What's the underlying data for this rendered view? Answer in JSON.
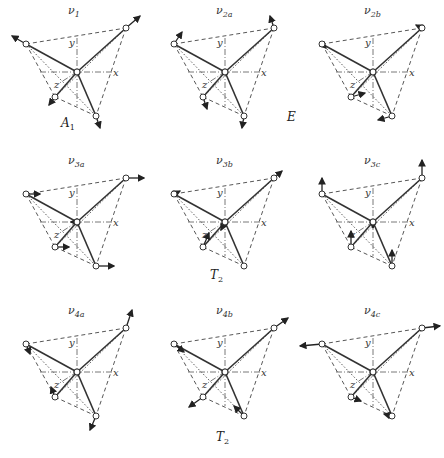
{
  "figure": {
    "axes_labels": {
      "x": "x",
      "y": "y",
      "z": "z"
    },
    "colors": {
      "line": "#333333",
      "dashed": "#444444",
      "atom_fill": "#ffffff",
      "arrow": "#222222"
    },
    "panels": [
      {
        "id": "v1",
        "label_base": "ν",
        "label_sub": "1",
        "arrows": "breathing"
      },
      {
        "id": "v2a",
        "label_base": "ν",
        "label_sub": "2a",
        "arrows": "bend-a"
      },
      {
        "id": "v2b",
        "label_base": "ν",
        "label_sub": "2b",
        "arrows": "bend-b"
      },
      {
        "id": "v3a",
        "label_base": "ν",
        "label_sub": "3a",
        "arrows": "x-stretch"
      },
      {
        "id": "v3b",
        "label_base": "ν",
        "label_sub": "3b",
        "arrows": "diag-stretch"
      },
      {
        "id": "v3c",
        "label_base": "ν",
        "label_sub": "3c",
        "arrows": "y-stretch"
      },
      {
        "id": "v4a",
        "label_base": "ν",
        "label_sub": "4a",
        "arrows": "bend-4a"
      },
      {
        "id": "v4b",
        "label_base": "ν",
        "label_sub": "4b",
        "arrows": "bend-4b"
      },
      {
        "id": "v4c",
        "label_base": "ν",
        "label_sub": "4c",
        "arrows": "bend-4c"
      }
    ],
    "symmetry_labels": [
      {
        "base": "A",
        "sub": "1",
        "row": 1,
        "near": "v1"
      },
      {
        "base": "E",
        "sub": "",
        "row": 1,
        "near": "between v2a and v2b"
      },
      {
        "base": "T",
        "sub": "2",
        "row": 2,
        "near": "v3b"
      },
      {
        "base": "T",
        "sub": "2",
        "row": 3,
        "near": "v4b"
      }
    ]
  }
}
